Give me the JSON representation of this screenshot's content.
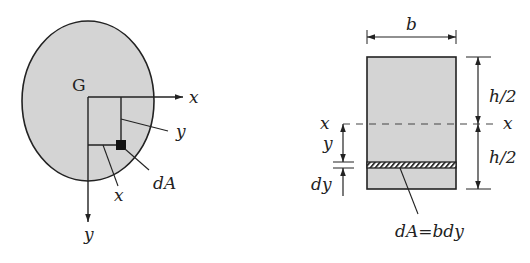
{
  "left_figure": {
    "origin_label": "G",
    "x_axis_label": "x",
    "y_axis_label": "y",
    "element_x_label": "x",
    "element_y_label": "y",
    "element_label": "dA"
  },
  "right_figure": {
    "width_label": "b",
    "upper_half_label": "h/2",
    "lower_half_label": "h/2",
    "neutral_axis_left_label": "x",
    "neutral_axis_right_label": "x",
    "y_label": "y",
    "dy_label": "dy",
    "strip_label": "dA=bdy"
  },
  "colors": {
    "fill": "#d4d4d4",
    "stroke": "#222222",
    "background": "#ffffff"
  }
}
